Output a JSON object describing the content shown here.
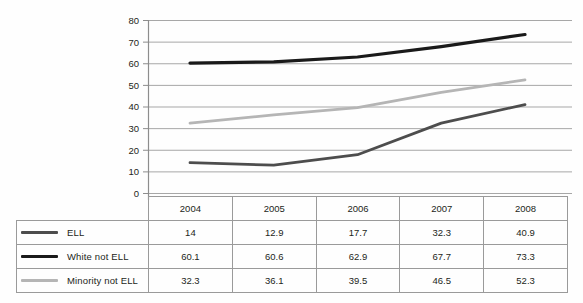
{
  "chart_data": {
    "type": "line",
    "title": "",
    "subtitle": "",
    "xlabel": "",
    "ylabel": "",
    "categories": [
      "2004",
      "2005",
      "2006",
      "2007",
      "2008"
    ],
    "x": [
      2004,
      2005,
      2006,
      2007,
      2008
    ],
    "ylim": [
      0,
      80
    ],
    "ytick_step": 10,
    "yticks": [
      "0",
      "10",
      "20",
      "30",
      "40",
      "50",
      "60",
      "70",
      "80"
    ],
    "grid": "horizontal",
    "legend_position": "table-left-column",
    "series": [
      {
        "name": "ELL",
        "values": [
          14,
          12.9,
          17.7,
          32.3,
          40.9
        ],
        "color": "#4d4d4d"
      },
      {
        "name": "White not ELL",
        "values": [
          60.1,
          60.6,
          62.9,
          67.7,
          73.3
        ],
        "color": "#1a1a1a"
      },
      {
        "name": "Minority not ELL",
        "values": [
          32.3,
          36.1,
          39.5,
          46.5,
          52.3
        ],
        "color": "#b5b5b5"
      }
    ]
  },
  "table": {
    "header_blank": "",
    "year_headers": [
      "2004",
      "2005",
      "2006",
      "2007",
      "2008"
    ],
    "rows": [
      {
        "label": "ELL",
        "cells": [
          "14",
          "12.9",
          "17.7",
          "32.3",
          "40.9"
        ]
      },
      {
        "label": "White not ELL",
        "cells": [
          "60.1",
          "60.6",
          "62.9",
          "67.7",
          "73.3"
        ]
      },
      {
        "label": "Minority not ELL",
        "cells": [
          "32.3",
          "36.1",
          "39.5",
          "46.5",
          "52.3"
        ]
      }
    ]
  },
  "colors": {
    "ell": "#4d4d4d",
    "white_not_ell": "#1a1a1a",
    "minority_not_ell": "#b5b5b5",
    "gridline": "#a7a7a7",
    "axis": "#8d8d8d",
    "table_border": "#9a9a9a",
    "text": "#231f20",
    "background": "#fefefe"
  }
}
